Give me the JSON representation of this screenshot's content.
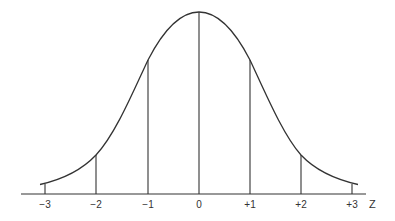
{
  "diagram": {
    "type": "normal-distribution-curve",
    "axis_label": "Z",
    "ticks": [
      {
        "label": "−3",
        "z": -3,
        "x": 45,
        "line_top": 184
      },
      {
        "label": "−2",
        "z": -2,
        "x": 96,
        "line_top": 155
      },
      {
        "label": "−1",
        "z": -1,
        "x": 148,
        "line_top": 60
      },
      {
        "label": "0",
        "z": 0,
        "x": 199,
        "line_top": 12
      },
      {
        "label": "+1",
        "z": 1,
        "x": 250,
        "line_top": 60
      },
      {
        "label": "+2",
        "z": 2,
        "x": 301,
        "line_top": 155
      },
      {
        "label": "+3",
        "z": 3,
        "x": 352,
        "line_top": 184
      }
    ],
    "colors": {
      "curve": "#333333",
      "lines": "#333333",
      "axis": "#333333"
    }
  }
}
